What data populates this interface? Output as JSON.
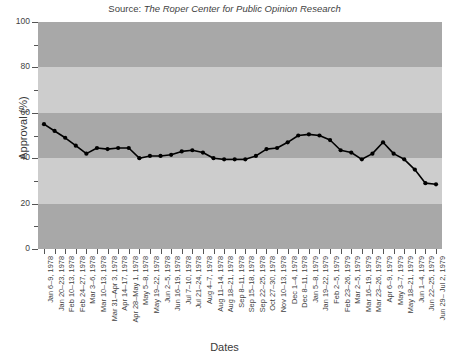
{
  "source_note": {
    "prefix": "Source: ",
    "italic_text": "The Roper Center for Public Opinion Research",
    "full": "Source: The Roper Center for Public Opinion Research"
  },
  "axis_titles": {
    "x": "Dates",
    "y": "Approval (%)"
  },
  "colors": {
    "band_dark": "#a8a8a8",
    "band_light": "#cdcdcd",
    "series_line": "#000000",
    "marker": "#000000",
    "text": "#3f3f3f",
    "page_background": "#ffffff"
  },
  "chart_data": {
    "type": "line",
    "title": "Source: The Roper Center for Public Opinion Research",
    "xlabel": "Dates",
    "ylabel": "Approval (%)",
    "ylim": [
      0,
      100
    ],
    "y_major_ticks": [
      0,
      20,
      40,
      60,
      80,
      100
    ],
    "y_major_tick_labels": [
      "0",
      "20",
      "40",
      "60",
      "80",
      "100"
    ],
    "y_minor_ticks": [
      10,
      30,
      50,
      70,
      90
    ],
    "grid": false,
    "legend": false,
    "banded_background": true,
    "band_interval": 20,
    "categories": [
      "Jan 6–9, 1978",
      "Jan 20–23, 1978",
      "Feb 10–13, 1978",
      "Feb 24–27, 1978",
      "Mar 3–6, 1978",
      "Mar 10–13, 1978",
      "Mar 31–Apr 3, 1978",
      "Apr 14–17, 1978",
      "Apr 28–May 1, 1978",
      "May 5–8, 1978",
      "May 19–22, 1978",
      "Jun 2–5, 1978",
      "Jun 16–19, 1978",
      "Jul 7–10, 1978",
      "Jul 21–24, 1978",
      "Aug 4–7, 1978",
      "Aug 11–14, 1978",
      "Aug 18–21, 1978",
      "Sep 8–11, 1978",
      "Sep 15–18, 1978",
      "Sep 22–25, 1978",
      "Oct 27–30, 1978",
      "Nov 10–13, 1978",
      "Dec 1–4, 1978",
      "Dec 8–11, 1978",
      "Jan 5–8, 1979",
      "Jan 19–22, 1979",
      "Feb 2–5, 1979",
      "Feb 23–26, 1979",
      "Mar 2–5, 1979",
      "Mar 16–19, 1979",
      "Mar 23–26, 1979",
      "Apr 6–9, 1979",
      "May 3–7, 1979",
      "May 18–21, 1979",
      "Jun 1–4, 1979",
      "Jun 22–25, 1979",
      "Jun 29– Jul 2, 1979"
    ],
    "values": [
      55,
      52,
      49,
      45.5,
      42,
      44.5,
      44,
      44.5,
      44.5,
      40,
      41,
      41,
      41.5,
      43,
      43.5,
      42.5,
      40,
      39.5,
      39.5,
      39.5,
      41,
      44,
      44.5,
      47,
      50,
      50.5,
      50,
      48,
      43.5,
      42.5,
      39.5,
      42,
      47,
      42,
      39.5,
      35,
      29,
      28.5
    ],
    "series": [
      {
        "name": "Presidential approval",
        "values": [
          55,
          52,
          49,
          45.5,
          42,
          44.5,
          44,
          44.5,
          44.5,
          40,
          41,
          41,
          41.5,
          43,
          43.5,
          42.5,
          40,
          39.5,
          39.5,
          39.5,
          41,
          44,
          44.5,
          47,
          50,
          50.5,
          50,
          48,
          43.5,
          42.5,
          39.5,
          42,
          47,
          42,
          39.5,
          35,
          29,
          28.5
        ],
        "marker": "circle",
        "line_style": "solid"
      }
    ]
  }
}
